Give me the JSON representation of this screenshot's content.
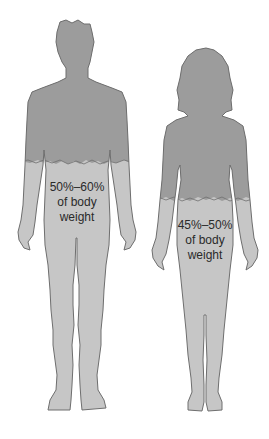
{
  "figure": {
    "colors": {
      "background": "#ffffff",
      "upper_body": "#9c9c9c",
      "lower_body": "#c6c6c6",
      "outline": "#6e6e6e",
      "text": "#2a2a2a"
    },
    "male": {
      "label_line1": "50%–60%",
      "label_line2": "of body",
      "label_line3": "weight"
    },
    "female": {
      "label_line1": "45%–50%",
      "label_line2": "of body",
      "label_line3": "weight"
    }
  }
}
